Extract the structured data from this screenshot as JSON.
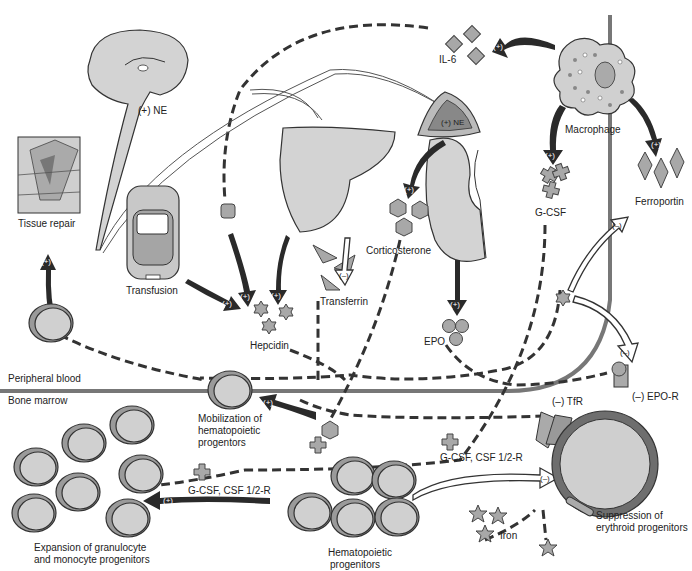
{
  "diagram": {
    "regions": {
      "upper": "Peripheral blood",
      "lower": "Bone marrow"
    },
    "labels": {
      "nervous_ne": "(+) NE",
      "adrenal_ne": "(+) NE",
      "il6": "IL-6",
      "macrophage": "Macrophage",
      "ferroportin": "Ferroportin",
      "gcsf": "G-CSF",
      "corticosterone": "Corticosterone",
      "transferrin": "Transferrin",
      "hepcidin": "Hepcidin",
      "transfusion": "Transfusion",
      "tissue_repair": "Tissue repair",
      "epo": "EPO",
      "tfr": "(–) TfR",
      "epo_r": "(–) EPO-R",
      "mobilization_line1": "Mobilization of",
      "mobilization_line2": "hematopoietic",
      "mobilization_line3": "progentors",
      "gcsf_csf_left": "G-CSF, CSF 1/2-R",
      "gcsf_csf_right": "G-CSF, CSF 1/2-R",
      "expansion_line1": "Expansion of granulocyte",
      "expansion_line2": "and monocyte progenitors",
      "hemato_line1": "Hematopoietic",
      "hemato_line2": "progenitors",
      "suppression_line1": "Suppression of",
      "suppression_line2": "erythroid progenitors",
      "iron": "Iron"
    },
    "signs": {
      "plus": "(+)",
      "minus": "(–)"
    },
    "colors": {
      "arrow_dark": "#2a2a2a",
      "cell_fill": "#d0d0d0",
      "cell_ring": "#9a9a9a",
      "erythroid_ring": "#6e6e6e",
      "boundary": "#777777"
    }
  }
}
